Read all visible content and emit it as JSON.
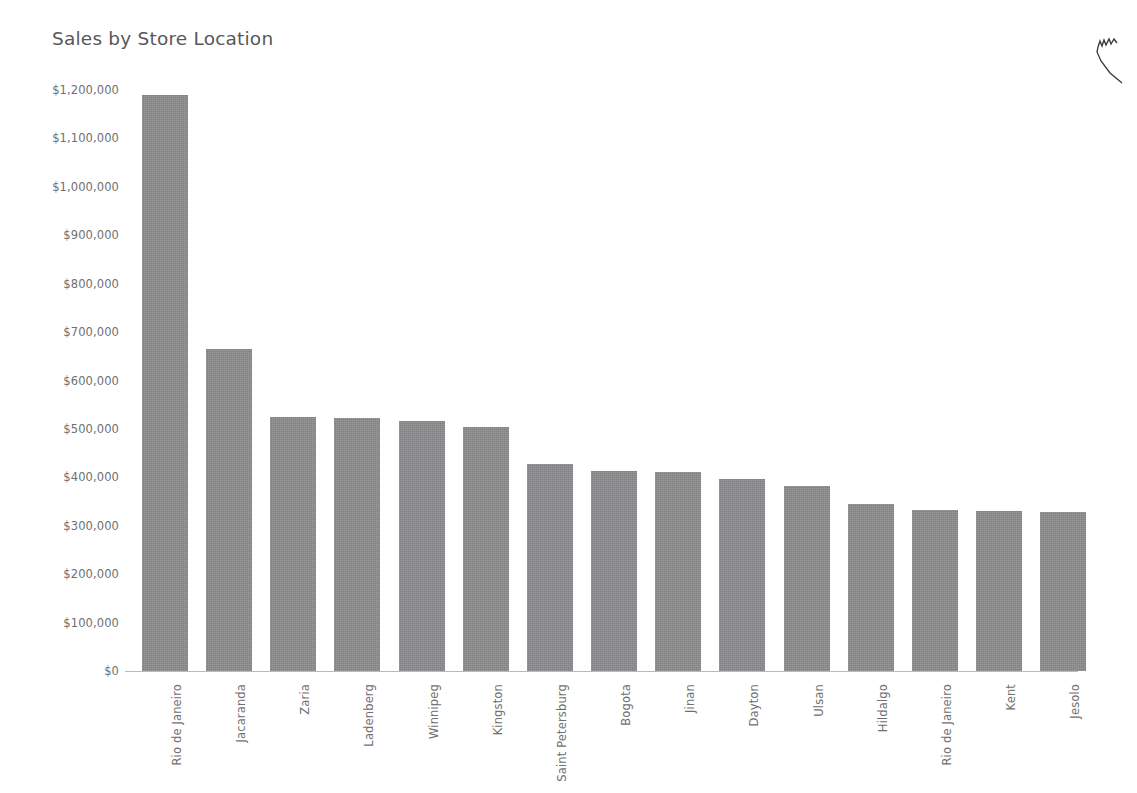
{
  "chart_data": {
    "type": "bar",
    "title": "Sales by Store Location",
    "xlabel": "",
    "ylabel": "",
    "ylim": [
      0,
      1200000
    ],
    "grid": false,
    "legend": null,
    "value_prefix": "$",
    "categories": [
      "Rio de Janeiro",
      "Jacaranda",
      "Zaria",
      "Ladenberg",
      "Winnipeg",
      "Kingston",
      "Saint Petersburg",
      "Bogota",
      "Jinan",
      "Dayton",
      "Ulsan",
      "Hildalgo",
      "Rio de Janeiro",
      "Kent",
      "Jesolo"
    ],
    "values": [
      1190000,
      665000,
      525000,
      522000,
      516000,
      504000,
      427000,
      413000,
      412000,
      396000,
      383000,
      345000,
      333000,
      331000,
      329000
    ],
    "ytick_values": [
      1200000,
      1100000,
      1000000,
      900000,
      800000,
      700000,
      600000,
      500000,
      400000,
      300000,
      200000,
      100000,
      0
    ],
    "ytick_labels": [
      "$1,200,000",
      "$1,100,000",
      "$1,000,000",
      "$900,000",
      "$800,000",
      "$700,000",
      "$600,000",
      "$500,000",
      "$400,000",
      "$300,000",
      "$200,000",
      "$100,000",
      "$0"
    ],
    "bar_color": "#8c8c8e",
    "text_color": "#6f6f71",
    "title_color": "#58585a",
    "axis_color": "#b9b9b9",
    "background_color": "#ffffff"
  },
  "artifacts": {
    "corner_mark": "pen-mark-icon"
  }
}
